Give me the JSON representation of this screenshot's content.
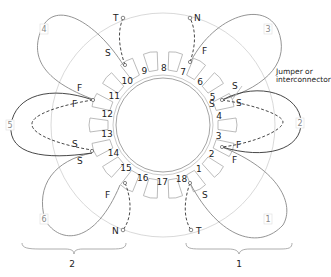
{
  "diagram": {
    "type": "stator winding diagram",
    "slot_count": 18,
    "slots": [
      "1",
      "2",
      "3",
      "4",
      "5",
      "6",
      "7",
      "8",
      "9",
      "10",
      "11",
      "12",
      "13",
      "14",
      "15",
      "16",
      "17",
      "18"
    ],
    "coils": [
      {
        "number": "1",
        "start_slot": "1",
        "end_slot": "3",
        "start_label": "S",
        "end_label": "F"
      },
      {
        "number": "2",
        "start_slot": "5",
        "end_slot": "3",
        "start_label": "S",
        "end_label": "F"
      },
      {
        "number": "3",
        "start_slot": "5",
        "end_slot": "7",
        "start_label": "S",
        "end_label": "F"
      },
      {
        "number": "4",
        "start_slot": "10",
        "end_slot": "12",
        "start_label": "S",
        "end_label": "F"
      },
      {
        "number": "5",
        "start_slot": "14",
        "end_slot": "12",
        "start_label": "S",
        "end_label": "F"
      },
      {
        "number": "6",
        "start_slot": "14",
        "end_slot": "16",
        "start_label": "S",
        "end_label": "F"
      }
    ],
    "terminals": [
      {
        "label": "T",
        "slot": "10"
      },
      {
        "label": "N",
        "slot": "7"
      },
      {
        "label": "N",
        "slot": "16"
      },
      {
        "label": "T",
        "slot": "1"
      }
    ],
    "annotation": {
      "line1": "Jumper or",
      "line2": "interconnector"
    },
    "groups": [
      {
        "label": "2",
        "coils": [
          "4",
          "5",
          "6"
        ]
      },
      {
        "label": "1",
        "coils": [
          "1",
          "2",
          "3"
        ]
      }
    ],
    "pin_labels": {
      "s": "S",
      "f": "F",
      "t": "T",
      "n": "N"
    }
  }
}
